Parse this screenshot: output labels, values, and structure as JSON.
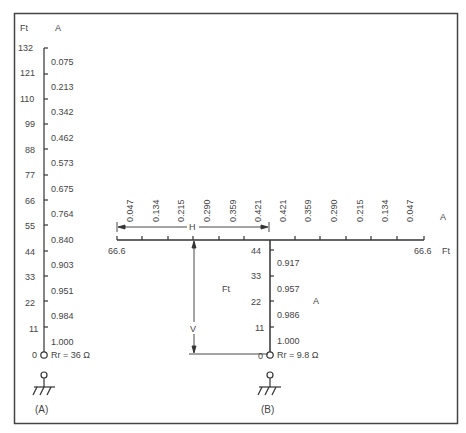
{
  "diagram": {
    "colors": {
      "line": "#333333",
      "frame": "#444444",
      "text": "#444444"
    },
    "panel_a": {
      "caption": "(A)",
      "height_unit": "Ft",
      "current_unit": "A",
      "heights_ft": [
        "132",
        "121",
        "110",
        "99",
        "88",
        "77",
        "66",
        "55",
        "44",
        "33",
        "22",
        "11",
        "0"
      ],
      "currents_a": [
        "0.075",
        "0.213",
        "0.342",
        "0.462",
        "0.573",
        "0.675",
        "0.764",
        "0.840",
        "0.903",
        "0.951",
        "0.984",
        "1.000"
      ],
      "radiation_resistance": "Rr = 36 Ω",
      "feed_icon": "feedpoint-circle",
      "ground_icon": "ground-symbol"
    },
    "panel_b": {
      "caption": "(B)",
      "vertical": {
        "height_unit": "Ft",
        "current_unit": "A",
        "heights_ft": [
          "44",
          "33",
          "22",
          "11",
          "0"
        ],
        "currents_a": [
          "0.917",
          "0.957",
          "0.986",
          "1.000"
        ],
        "radiation_resistance": "Rr = 9.8 Ω"
      },
      "horizontal": {
        "length_unit": "Ft",
        "current_unit": "A",
        "left_end_ft": "66.6",
        "right_end_ft": "66.6",
        "left_currents_a": [
          "0.047",
          "0.134",
          "0.215",
          "0.290",
          "0.359",
          "0.421"
        ],
        "right_currents_a": [
          "0.421",
          "0.359",
          "0.290",
          "0.215",
          "0.134",
          "0.047"
        ]
      },
      "dimension_h": "H",
      "dimension_v": "V",
      "feed_icon": "feedpoint-circle",
      "ground_icon": "ground-symbol"
    }
  }
}
